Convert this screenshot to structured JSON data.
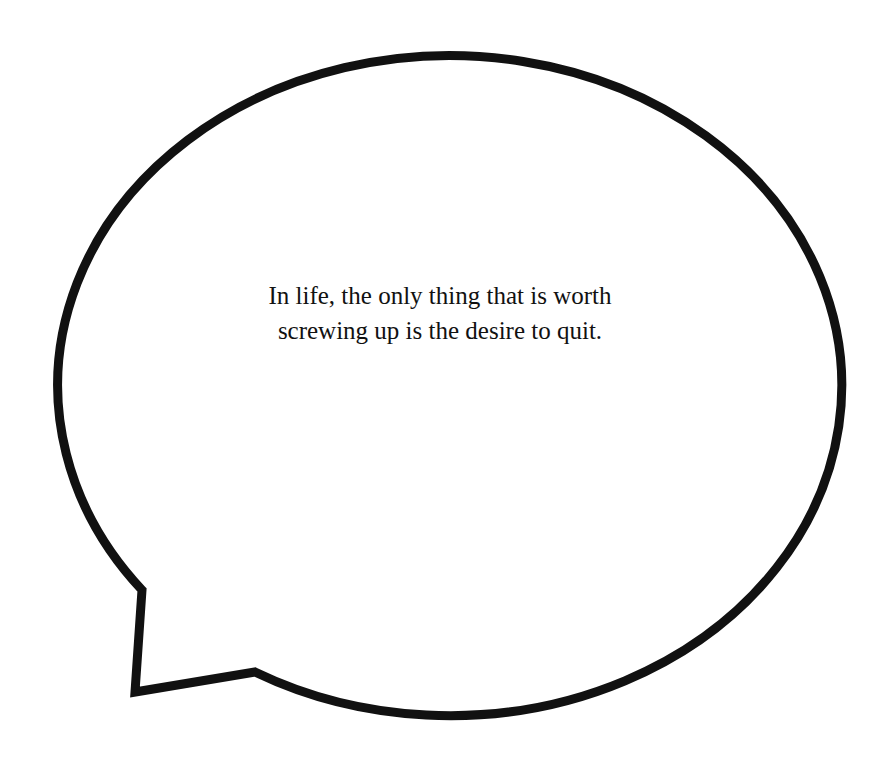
{
  "speech_bubble": {
    "quote_lines": [
      "In life, the only thing that is worth",
      "screwing up is the desire to quit."
    ],
    "stroke_color": "#111111",
    "fill_color": "#ffffff"
  }
}
